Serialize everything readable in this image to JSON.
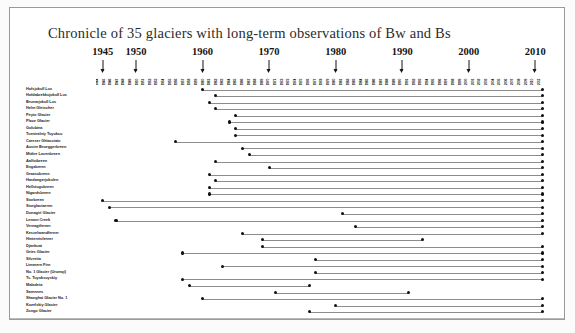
{
  "figure": {
    "title": "Chronicle of 35 glaciers with long-term observations of Bw and Bs",
    "frame_color": "#9a9a9a",
    "bar_color": "#8c8c8c",
    "marker_color": "#101010"
  },
  "axis": {
    "labels": [
      "1945",
      "1950",
      "1960",
      "1970",
      "1980",
      "1990",
      "2000",
      "2010"
    ],
    "x_min_year": 1944,
    "x_max_year": 2011,
    "ruler_ticks": [
      "1944",
      "1945",
      "1946",
      "1947",
      "1948",
      "1949",
      "1950",
      "1951",
      "1952",
      "1953",
      "1954",
      "1955",
      "1956",
      "1957",
      "1958",
      "1959",
      "1960",
      "1961",
      "1962",
      "1963",
      "1964",
      "1965",
      "1966",
      "1967",
      "1968",
      "1969",
      "1970",
      "1971",
      "1972",
      "1973",
      "1974",
      "1975",
      "1976",
      "1977",
      "1978",
      "1979",
      "1980",
      "1981",
      "1982",
      "1983",
      "1984",
      "1985",
      "1986",
      "1987",
      "1988",
      "1989",
      "1990",
      "1991",
      "1992",
      "1993",
      "1994",
      "1995",
      "1996",
      "1997",
      "1998",
      "1999",
      "2000",
      "2001",
      "2002",
      "2003",
      "2004",
      "2005",
      "2006",
      "2007",
      "2008",
      "2009",
      "2010",
      "2011"
    ]
  },
  "chart_data": {
    "type": "bar",
    "title": "Chronicle of 35 glaciers with long-term observations of Bw and Bs",
    "xlabel": "Year",
    "ylabel": "Glacier",
    "xlim": [
      1944,
      2011
    ],
    "grid": false,
    "legend": "none",
    "orientation": "horizontal-range",
    "note": "Each row is one glacier; the horizontal line spans its period of record (Bw = winter balance, Bs = summer balance).",
    "categories": [
      "Hofsjokull Lus",
      "Hofdabrekkujokull Lus",
      "Brunarjokull Lus",
      "Helm Gletscher",
      "Peyto Glacier",
      "Place Glacier",
      "Golubina",
      "Tsentralniy Tuyuksu",
      "Careser Ghiacciaio",
      "Austre Broeggerbreen",
      "Midtre Lovenbreen",
      "Aalfotbreen",
      "Engabreen",
      "Graasubreen",
      "Hardangerjokulen",
      "Hellstugubreen",
      "Nigardsbreen",
      "Storbreen",
      "Storglaciaeren",
      "Dunagiri Glacier",
      "Lemon Creek",
      "Vernagtferner",
      "Kesselwandferner",
      "Hintereisferner",
      "Djankuat",
      "Gries Glacier",
      "Silvretta",
      "Limmern Firn",
      "No. 1 Glacier (Urumqi)",
      "Ts. Tuyuksuyskiy",
      "Maladeta",
      "Sarennes",
      "Shanghai Glacier No. 1",
      "Kozelskiy Glacier",
      "Zongo Glacier"
    ],
    "series": [
      {
        "name": "Period of record",
        "ranges": [
          {
            "glacier": "Hofsjokull Lus",
            "start": 1960,
            "end": 2011
          },
          {
            "glacier": "Hofdabrekkujokull Lus",
            "start": 1962,
            "end": 2011
          },
          {
            "glacier": "Brunarjokull Lus",
            "start": 1961,
            "end": 2011
          },
          {
            "glacier": "Helm Gletscher",
            "start": 1962,
            "end": 2011
          },
          {
            "glacier": "Peyto Glacier",
            "start": 1965,
            "end": 2011
          },
          {
            "glacier": "Place Glacier",
            "start": 1964,
            "end": 2011
          },
          {
            "glacier": "Golubina",
            "start": 1965,
            "end": 2011
          },
          {
            "glacier": "Tsentralniy Tuyuksu",
            "start": 1965,
            "end": 2011
          },
          {
            "glacier": "Careser Ghiacciaio",
            "start": 1956,
            "end": 2011
          },
          {
            "glacier": "Austre Broeggerbreen",
            "start": 1966,
            "end": 2011
          },
          {
            "glacier": "Midtre Lovenbreen",
            "start": 1967,
            "end": 2011
          },
          {
            "glacier": "Aalfotbreen",
            "start": 1962,
            "end": 2011
          },
          {
            "glacier": "Engabreen",
            "start": 1970,
            "end": 2011
          },
          {
            "glacier": "Graasubreen",
            "start": 1961,
            "end": 2011
          },
          {
            "glacier": "Hardangerjokulen",
            "start": 1962,
            "end": 2011
          },
          {
            "glacier": "Hellstugubreen",
            "start": 1961,
            "end": 2011
          },
          {
            "glacier": "Nigardsbreen",
            "start": 1961,
            "end": 2011
          },
          {
            "glacier": "Storbreen",
            "start": 1945,
            "end": 2011
          },
          {
            "glacier": "Storglaciaeren",
            "start": 1946,
            "end": 2011
          },
          {
            "glacier": "Dunagiri Glacier",
            "start": 1981,
            "end": 2011
          },
          {
            "glacier": "Lemon Creek",
            "start": 1947,
            "end": 2011
          },
          {
            "glacier": "Vernagtferner",
            "start": 1983,
            "end": 2011
          },
          {
            "glacier": "Kesselwandferner",
            "start": 1966,
            "end": 2011
          },
          {
            "glacier": "Hintereisferner",
            "start": 1969,
            "end": 1993
          },
          {
            "glacier": "Djankuat",
            "start": 1969,
            "end": 2011
          },
          {
            "glacier": "Gries Glacier",
            "start": 1957,
            "end": 2011
          },
          {
            "glacier": "Silvretta",
            "start": 1977,
            "end": 2011
          },
          {
            "glacier": "Limmern Firn",
            "start": 1963,
            "end": 2011
          },
          {
            "glacier": "No. 1 Glacier (Urumqi)",
            "start": 1977,
            "end": 2011
          },
          {
            "glacier": "Ts. Tuyuksuyskiy",
            "start": 1957,
            "end": 2011
          },
          {
            "glacier": "Maladeta",
            "start": 1958,
            "end": 1976
          },
          {
            "glacier": "Sarennes",
            "start": 1971,
            "end": 1991
          },
          {
            "glacier": "Shanghai Glacier No. 1",
            "start": 1960,
            "end": 2011
          },
          {
            "glacier": "Kozelskiy Glacier",
            "start": 1980,
            "end": 2011
          },
          {
            "glacier": "Zongo Glacier",
            "start": 1976,
            "end": 2011
          }
        ]
      }
    ]
  }
}
